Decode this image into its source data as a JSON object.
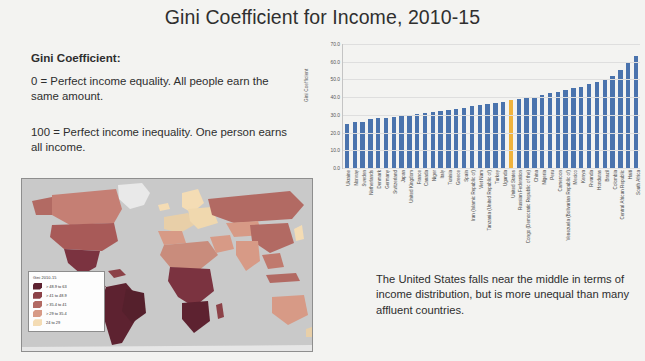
{
  "title": "Gini Coefficient for Income, 2010-15",
  "left_text": {
    "heading": "Gini Coefficient:",
    "paragraph1": "0 = Perfect income equality. All people earn the same amount.",
    "paragraph2": "100 = Perfect income inequality. One person earns all income."
  },
  "caption": "The United States falls near the middle in terms of income distribution, but is more unequal than many affluent countries.",
  "map": {
    "ocean_color": "#c9c9c9",
    "legend": {
      "title": "Gini 2010-15",
      "entries": [
        {
          "label": "> 48.9 to 63",
          "color": "#5d2230"
        },
        {
          "label": "> 41 to 48.9",
          "color": "#8c4248"
        },
        {
          "label": "> 35.4 to 41",
          "color": "#b26a63"
        },
        {
          "label": "> 29 to 35.4",
          "color": "#d79a86"
        },
        {
          "label": "24 to 29",
          "color": "#f4dcb4"
        }
      ]
    }
  },
  "chart_data": {
    "type": "bar",
    "title": "",
    "xlabel": "",
    "ylabel": "Gini Coefficient",
    "ylim": [
      0,
      70
    ],
    "yticks": [
      "0.0",
      "10.0",
      "20.0",
      "30.0",
      "40.0",
      "50.0",
      "60.0",
      "70.0"
    ],
    "grid": true,
    "bar_color": "#4a73ad",
    "highlight_color": "#f0b33c",
    "highlight_category": "United States",
    "categories": [
      "Ukraine",
      "Norway",
      "Sweden",
      "Netherlands",
      "Denmark",
      "Germany",
      "Switzerland",
      "Japan",
      "United Kingdom",
      "France",
      "Canada",
      "Niger",
      "Italy",
      "Tunisia",
      "Greece",
      "Spain",
      "Iran (Islamic Republic of)",
      "Viet Nam",
      "Tanzania (United Republic of)",
      "Turkey",
      "Uganda",
      "United States",
      "Russian Federation",
      "Congo (Democratic Republic of the)",
      "China",
      "Nigeria",
      "Peru",
      "Cameroon",
      "Venezuela (Bolivarian Republic of)",
      "Mexico",
      "Kenya",
      "Rwanda",
      "Honduras",
      "Brazil",
      "Colombia",
      "Central African Republic",
      "Haiti",
      "South Africa"
    ],
    "values": [
      24.6,
      25.9,
      26.1,
      27.9,
      28.1,
      28.3,
      28.7,
      29.2,
      30.2,
      30.7,
      31.2,
      31.6,
      32.2,
      32.8,
      33.4,
      34.1,
      35.2,
      35.6,
      36.1,
      36.8,
      37.4,
      38.4,
      39.0,
      39.8,
      40.2,
      41.1,
      42.6,
      43.1,
      44.2,
      45.0,
      46.0,
      47.5,
      48.4,
      50.1,
      51.8,
      55.2,
      59.6,
      63.0
    ]
  }
}
